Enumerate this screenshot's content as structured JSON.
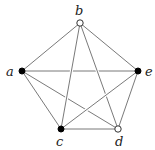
{
  "diagram": {
    "type": "graph",
    "vertices": [
      {
        "id": "a",
        "label": "a",
        "style": "filled"
      },
      {
        "id": "b",
        "label": "b",
        "style": "open"
      },
      {
        "id": "c",
        "label": "c",
        "style": "filled"
      },
      {
        "id": "d",
        "label": "d",
        "style": "open"
      },
      {
        "id": "e",
        "label": "e",
        "style": "filled"
      }
    ],
    "edges": [
      [
        "a",
        "b"
      ],
      [
        "b",
        "e"
      ],
      [
        "a",
        "c"
      ],
      [
        "c",
        "d"
      ],
      [
        "d",
        "e"
      ],
      [
        "b",
        "c"
      ],
      [
        "b",
        "d"
      ],
      [
        "c",
        "e"
      ],
      [
        "a",
        "e"
      ],
      [
        "a",
        "d"
      ]
    ]
  }
}
